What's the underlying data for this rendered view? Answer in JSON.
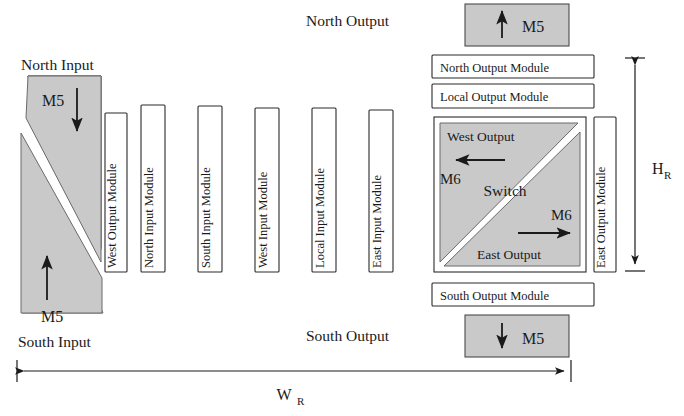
{
  "figure": {
    "colors": {
      "gray_fill": "#c9c9c9",
      "stroke": "#2b2b2b",
      "text": "#1a1a1a",
      "background": "#ffffff"
    }
  },
  "left_ports": {
    "north_input_label": "North Input",
    "south_input_label": "South Input",
    "north_metal": "M5",
    "south_metal": "M5",
    "north_arrow": "arrow-down-icon",
    "south_arrow": "arrow-up-icon"
  },
  "top_port": {
    "label": "North Output",
    "metal": "M5",
    "arrow": "arrow-up-icon"
  },
  "bottom_port": {
    "label": "South Output",
    "metal": "M5",
    "arrow": "arrow-down-icon"
  },
  "vertical_modules": [
    {
      "label": "West Output Module"
    },
    {
      "label": "North Input Module"
    },
    {
      "label": "South Input Module"
    },
    {
      "label": "West Input Module"
    },
    {
      "label": "Local Input Module"
    },
    {
      "label": "East Input Module"
    }
  ],
  "horizontal_modules": [
    {
      "label": "North Output Module"
    },
    {
      "label": "Local Output Module"
    },
    {
      "label": "South Output Module"
    }
  ],
  "right_module": {
    "label": "East Output Module"
  },
  "switch": {
    "center_label": "Switch",
    "west_output_label": "West Output",
    "west_metal": "M6",
    "west_arrow": "arrow-left-icon",
    "east_output_label": "East Output",
    "east_metal": "M6",
    "east_arrow": "arrow-right-icon"
  },
  "dimensions": {
    "width_label": "W",
    "width_subscript": "R",
    "height_label": "H",
    "height_subscript": "R"
  }
}
